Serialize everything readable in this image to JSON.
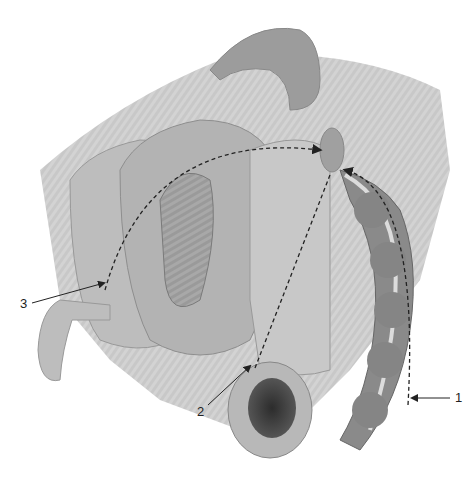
{
  "figure": {
    "type": "anatomical-illustration",
    "palette": {
      "background": "#ffffff",
      "tissue_light": "#c8c8c8",
      "tissue_mid": "#a9a9a9",
      "tissue_dark": "#6e6e6e",
      "lumen_dark": "#3a3a3a",
      "line": "#222222"
    },
    "labels": [
      {
        "id": "1",
        "text": "1"
      },
      {
        "id": "2",
        "text": "2"
      },
      {
        "id": "3",
        "text": "3"
      }
    ]
  }
}
